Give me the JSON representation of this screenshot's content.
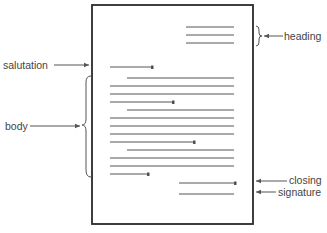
{
  "labels": {
    "heading": "heading",
    "salutation": "salutation",
    "body": "body",
    "closing": "closing",
    "signature": "signature"
  },
  "colors": {
    "frame": "#2a2a2a",
    "line": "#555555",
    "text": "#444444"
  },
  "page": {
    "x": 92,
    "y": 5,
    "width": 161,
    "height": 219
  },
  "heading_lines": [
    {
      "x1": 186,
      "x2": 234,
      "y": 27
    },
    {
      "x1": 186,
      "x2": 234,
      "y": 35
    },
    {
      "x1": 186,
      "x2": 234,
      "y": 43
    }
  ],
  "salutation_line": {
    "x1": 110,
    "x2": 152,
    "y": 67
  },
  "body_lines": [
    {
      "x1": 127,
      "x2": 234,
      "y": 78
    },
    {
      "x1": 110,
      "x2": 234,
      "y": 86
    },
    {
      "x1": 110,
      "x2": 234,
      "y": 94
    },
    {
      "x1": 110,
      "x2": 173,
      "y": 102
    },
    {
      "x1": 127,
      "x2": 234,
      "y": 110
    },
    {
      "x1": 110,
      "x2": 234,
      "y": 118
    },
    {
      "x1": 110,
      "x2": 234,
      "y": 126
    },
    {
      "x1": 110,
      "x2": 234,
      "y": 134
    },
    {
      "x1": 110,
      "x2": 194,
      "y": 142
    },
    {
      "x1": 127,
      "x2": 234,
      "y": 150
    },
    {
      "x1": 110,
      "x2": 234,
      "y": 158
    },
    {
      "x1": 110,
      "x2": 234,
      "y": 166
    },
    {
      "x1": 110,
      "x2": 148,
      "y": 174
    }
  ],
  "closing_line": {
    "x1": 179,
    "x2": 235,
    "y": 183
  },
  "signature_line": {
    "x1": 179,
    "x2": 234,
    "y": 194
  }
}
